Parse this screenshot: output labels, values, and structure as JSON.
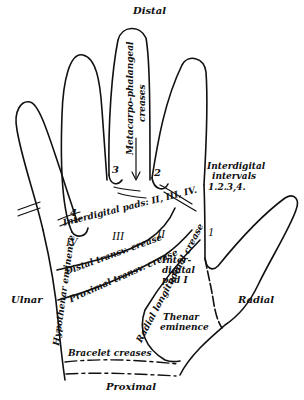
{
  "diagram": {
    "orientation": {
      "top": "Distal",
      "bottom": "Proximal",
      "left": "Ulnar",
      "right": "Radial"
    },
    "finger_numbers": [
      "2",
      "3",
      "4"
    ],
    "labels": {
      "metacarpo": "Metacarpo-phalangeal",
      "creases_mp": "creases",
      "interdigital_intervals_1": "Interdigital",
      "interdigital_intervals_2": "intervals",
      "interdigital_intervals_3": "1.2.3,4.",
      "interval_1": "1",
      "interdigital_pads": "Interdigital pads: II, III, IV.",
      "pad_iv": "IV",
      "pad_iii": "III",
      "pad_ii": "II",
      "distal_transv": "Distal transv. crease",
      "proximal_transv": "Proximal transv. crease",
      "radial_longitudinal": "Radial longitudinal crease",
      "interdigital_pad_i_1": "Inter-",
      "interdigital_pad_i_2": "digital",
      "interdigital_pad_i_3": "pad I",
      "hypothenar": "Hypothenar eminence",
      "thenar_1": "Thenar",
      "thenar_2": "eminence",
      "bracelet": "Bracelet creases"
    },
    "colors": {
      "ink": "#111111",
      "background": "#ffffff"
    }
  }
}
